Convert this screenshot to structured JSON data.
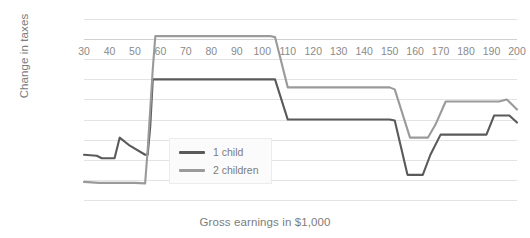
{
  "chart_data": {
    "type": "line",
    "title": "",
    "xlabel": "Gross earnings in $1,000",
    "ylabel": "Change in taxes",
    "xlim": [
      30,
      200
    ],
    "ylim": [
      -1600,
      200
    ],
    "xticks": [
      30,
      40,
      50,
      60,
      70,
      80,
      90,
      100,
      110,
      120,
      130,
      140,
      150,
      160,
      170,
      180,
      190,
      200
    ],
    "yticks": [
      200,
      0,
      -200,
      -400,
      -600,
      -800,
      -1000,
      -1200,
      -1400,
      -1600
    ],
    "ytick_labels": [
      "200",
      "0",
      "-200",
      "-400",
      "-600",
      "-800",
      "-1,000",
      "-1,200",
      "-1,400",
      "-1,600"
    ],
    "grid": true,
    "legend_position": "center",
    "series": [
      {
        "name": "1 child",
        "color": "#5a5a5a",
        "x": [
          30,
          35,
          37,
          42,
          44,
          48,
          54,
          55,
          56,
          57,
          104,
          105,
          110,
          150,
          152,
          157,
          163,
          166,
          170,
          188,
          191,
          197,
          200
        ],
        "values": [
          -1150,
          -1160,
          -1185,
          -1185,
          -980,
          -1060,
          -1150,
          -1150,
          -870,
          -400,
          -400,
          -400,
          -800,
          -800,
          -810,
          -1350,
          -1350,
          -1150,
          -950,
          -950,
          -760,
          -760,
          -830
        ]
      },
      {
        "name": "2 children",
        "color": "#9a9a9a",
        "x": [
          30,
          36,
          50,
          54,
          55,
          57,
          58,
          103,
          105,
          110,
          150,
          152,
          158,
          165,
          168,
          172,
          193,
          196,
          200
        ],
        "values": [
          -1420,
          -1430,
          -1430,
          -1435,
          -1100,
          -300,
          30,
          30,
          20,
          -480,
          -480,
          -500,
          -980,
          -980,
          -850,
          -620,
          -620,
          -600,
          -700
        ]
      }
    ]
  },
  "legend": {
    "items": [
      {
        "label": "1 child",
        "color": "#5a5a5a"
      },
      {
        "label": "2 children",
        "color": "#9a9a9a"
      }
    ]
  },
  "axis": {
    "y_title": "Change in taxes",
    "x_title": "Gross earnings in $1,000"
  }
}
